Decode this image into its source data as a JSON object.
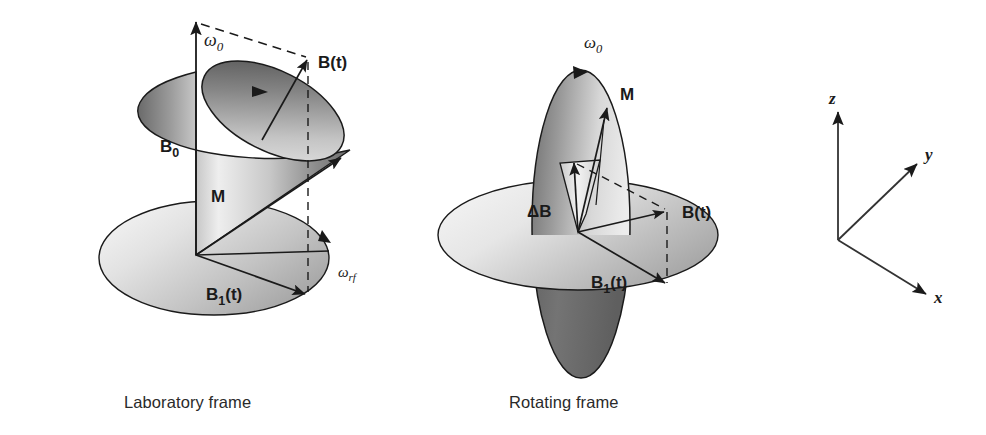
{
  "figure": {
    "background_color": "#ffffff",
    "stroke_color": "#1a1a1a"
  },
  "captions": {
    "laboratory": "Laboratory frame",
    "rotating": "Rotating frame"
  },
  "panels": [
    {
      "id": "laboratory-frame",
      "caption": "Laboratory frame",
      "labels": {
        "omega0": "ω0",
        "omega0_base": "ω",
        "omega0_sub": "0",
        "b0": "B0",
        "b0_base": "B",
        "b0_sub": "0",
        "m": "M",
        "bt": "B(t)",
        "b1t": "B1(t)",
        "b1t_base": "B",
        "b1t_sub": "1",
        "b1t_tail": "(t)",
        "omega_rf": "ωrf",
        "omega_rf_base": "ω",
        "omega_rf_sub": "rf"
      }
    },
    {
      "id": "rotating-frame",
      "caption": "Rotating frame",
      "labels": {
        "omega0": "ω0",
        "omega0_base": "ω",
        "omega0_sub": "0",
        "m": "M",
        "delta_b": "ΔB",
        "bt": "B(t)",
        "b1t": "B1(t)",
        "b1t_base": "B",
        "b1t_sub": "1",
        "b1t_tail": "(t)"
      }
    }
  ],
  "axes": {
    "id": "coordinate-axes",
    "labels": {
      "z": "z",
      "y": "y",
      "x": "x"
    }
  },
  "colors": {
    "stroke": "#1a1a1a",
    "cone_light": "#f2f2f2",
    "cone_mid": "#a8a8a8",
    "cone_dark": "#555555",
    "disc_light": "#ededed",
    "disc_mid": "#b5b5b5",
    "disc_dark": "#8a8a8a",
    "ellipse_dark": "#6f6f6f",
    "text": "#2a2a2a"
  }
}
